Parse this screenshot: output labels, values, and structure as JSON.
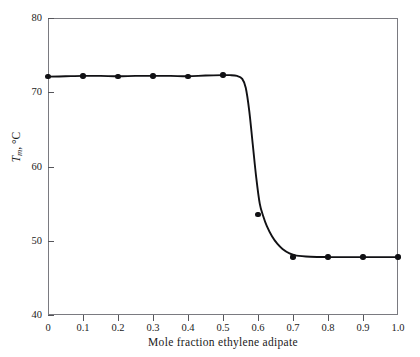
{
  "figure": {
    "top_caption_remnant": "· · ·",
    "frame": {
      "left": 48,
      "top": 18,
      "width": 350,
      "height": 297
    }
  },
  "chart_data": {
    "type": "line",
    "title": "",
    "xlabel": "Mole fraction ethylene adipate",
    "ylabel": "Tm, °C",
    "ylabel_parts": {
      "symbol": "T",
      "subscript": "m",
      "separator": ", ",
      "unit": "°C"
    },
    "xlim": [
      0,
      1
    ],
    "ylim": [
      40,
      80
    ],
    "xticks": [
      0,
      0.1,
      0.2,
      0.3,
      0.4,
      0.5,
      0.6,
      0.7,
      0.8,
      0.9,
      1.0
    ],
    "xticklabels": [
      "0",
      "0.1",
      "0.2",
      "0.3",
      "0.4",
      "0.5",
      "0.6",
      "0.7",
      "0.8",
      "0.9",
      "1.0"
    ],
    "yticks": [
      40,
      50,
      60,
      70,
      80
    ],
    "yticklabels": [
      "40",
      "50",
      "60",
      "70",
      "80"
    ],
    "grid": false,
    "legend": null,
    "series": [
      {
        "name": "melting point",
        "marker": "filled-circle",
        "line": "solid",
        "color": "#111114",
        "x": [
          0.0,
          0.1,
          0.2,
          0.3,
          0.4,
          0.5,
          0.6,
          0.7,
          0.8,
          0.9,
          1.0
        ],
        "y": [
          72.1,
          72.2,
          72.1,
          72.2,
          72.1,
          72.3,
          53.5,
          47.8,
          47.8,
          47.8,
          47.8
        ]
      }
    ],
    "curve_x": [
      0.0,
      0.05,
      0.1,
      0.15,
      0.2,
      0.25,
      0.3,
      0.35,
      0.4,
      0.45,
      0.5,
      0.52,
      0.54,
      0.555,
      0.565,
      0.575,
      0.585,
      0.595,
      0.605,
      0.615,
      0.625,
      0.64,
      0.655,
      0.67,
      0.69,
      0.71,
      0.75,
      0.8,
      0.85,
      0.9,
      0.95,
      1.0
    ],
    "curve_y": [
      72.1,
      72.15,
      72.2,
      72.2,
      72.15,
      72.2,
      72.2,
      72.2,
      72.15,
      72.25,
      72.3,
      72.3,
      72.2,
      71.8,
      70.6,
      67.5,
      63.0,
      58.5,
      55.0,
      53.3,
      52.0,
      50.6,
      49.6,
      48.9,
      48.3,
      48.0,
      47.85,
      47.8,
      47.8,
      47.8,
      47.8,
      47.8
    ]
  }
}
